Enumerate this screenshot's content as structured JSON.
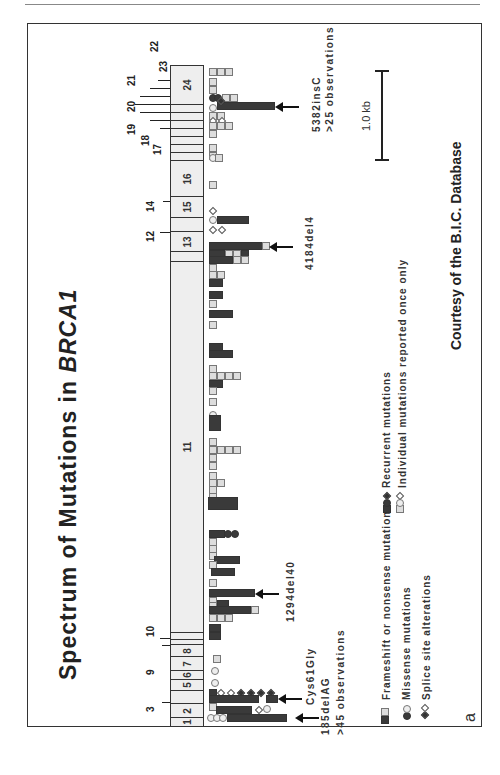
{
  "figure": {
    "title_prefix": "Spectrum of Mutations in ",
    "title_gene": "BRCA1",
    "panel_label": "a",
    "courtesy": "Courtesy of the B.I.C. Database",
    "scale_bar_label": "1.0 kb"
  },
  "exons": [
    {
      "label": "1"
    },
    {
      "label": "2"
    },
    {
      "label": "3"
    },
    {
      "label": "5"
    },
    {
      "label": "6"
    },
    {
      "label": "7"
    },
    {
      "label": "8"
    },
    {
      "label": "9"
    },
    {
      "label": "10"
    },
    {
      "label": "11"
    },
    {
      "label": "12"
    },
    {
      "label": "13"
    },
    {
      "label": "14"
    },
    {
      "label": "15"
    },
    {
      "label": "16"
    },
    {
      "label": "17"
    },
    {
      "label": "18"
    },
    {
      "label": "19"
    },
    {
      "label": "20"
    },
    {
      "label": "21"
    },
    {
      "label": "22"
    },
    {
      "label": "23"
    },
    {
      "label": "24"
    }
  ],
  "annotations": {
    "m5382": {
      "name": "5382insC",
      "note": ">25 observations"
    },
    "m4184": {
      "name": "4184del4"
    },
    "m1294": {
      "name": "1294del40"
    },
    "cys61": {
      "name": "Cys61Gly"
    },
    "m185": {
      "name": "185delAG",
      "note": ">45 observations"
    }
  },
  "legend": {
    "frameshift": "Frameshift or nonsense mutations",
    "missense": "Missense mutations",
    "splice": "Splice site alterations",
    "recurrent": "Recurrent mutations",
    "individual": "Individual mutations reported once only"
  },
  "colors": {
    "recurrent": "#3a3a3a",
    "individual": "#dddddd",
    "exon_fill": "#eeeeee",
    "frame": "#333333"
  }
}
